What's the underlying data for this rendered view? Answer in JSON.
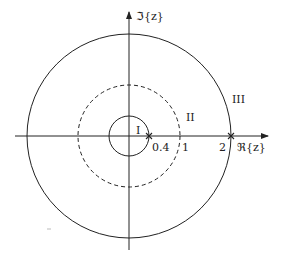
{
  "diagram": {
    "type": "z-plane region of convergence",
    "axes": {
      "imag_label": "ℑ{z}",
      "real_label": "ℜ{z}"
    },
    "circles": [
      {
        "name": "inner",
        "radius_value": 0.4,
        "style": "solid"
      },
      {
        "name": "unit",
        "radius_value": 1,
        "style": "dashed"
      },
      {
        "name": "outer",
        "radius_value": 2,
        "style": "solid"
      }
    ],
    "poles": [
      {
        "label": "0.4",
        "value": 0.4
      },
      {
        "label": "2",
        "value": 2
      }
    ],
    "tick_labels": {
      "p04": "0.4",
      "one": "1",
      "two": "2"
    },
    "regions": {
      "r1": "I",
      "r2": "II",
      "r3": "III"
    },
    "colors": {
      "line": "#222222",
      "background": "#ffffff"
    }
  }
}
